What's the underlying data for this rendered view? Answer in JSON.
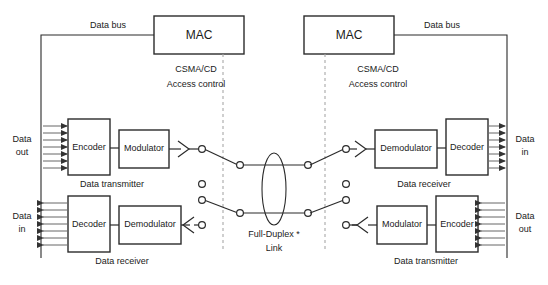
{
  "diagram": {
    "colors": {
      "stroke": "#2b2b2b",
      "dashed": "#9a9a9a",
      "arrow": "#555555",
      "background": "#ffffff"
    }
  },
  "bus": {
    "left_label": "Data bus",
    "right_label": "Data bus"
  },
  "mac": {
    "left_label": "MAC",
    "right_label": "MAC"
  },
  "access_control": {
    "left_line1": "CSMA/CD",
    "left_line2": "Access  control",
    "right_line1": "CSMA/CD",
    "right_line2": "Access  control"
  },
  "edge_labels": {
    "left_top_line1": "Data",
    "left_top_line2": "out",
    "left_bottom_line1": "Data",
    "left_bottom_line2": "in",
    "right_top_line1": "Data",
    "right_top_line2": "in",
    "right_bottom_line1": "Data",
    "right_bottom_line2": "out"
  },
  "blocks": {
    "left_encoder": "Encoder",
    "left_modulator": "Modulator",
    "left_decoder": "Decoder",
    "left_demodulator": "Demodulator",
    "right_demodulator": "Demodulator",
    "right_decoder": "Decoder",
    "right_modulator": "Modulator",
    "right_encoder": "Encoder"
  },
  "captions": {
    "left_transmitter": "Data transmitter",
    "left_receiver": "Data receiver",
    "right_receiver": "Data receiver",
    "right_transmitter": "Data transmitter"
  },
  "link": {
    "line1": "Full-Duplex *",
    "line2": "Link"
  },
  "counts": {
    "arrows_per_bundle": 7,
    "switch_pairs": 4,
    "idle_contacts": 2
  }
}
